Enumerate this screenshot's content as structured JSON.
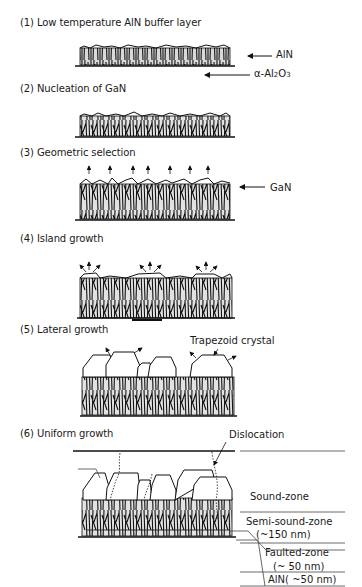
{
  "steps": [
    {
      "number": "(1)",
      "title": "Low temperature AlN buffer layer"
    },
    {
      "number": "(2)",
      "title": "Nucleation of GaN"
    },
    {
      "number": "(3)",
      "title": "Geometric selection"
    },
    {
      "number": "(4)",
      "title": "Island growth"
    },
    {
      "number": "(5)",
      "title": "Lateral growth"
    },
    {
      "number": "(6)",
      "title": "Uniform growth"
    }
  ],
  "labels": {
    "aln": "AlN",
    "sapphire_prefix": "α-Al",
    "sapphire_sub1": "2",
    "sapphire_mid": "O",
    "sapphire_sub2": "3",
    "gan": "GaN",
    "trapezoid": "Trapezoid crystal",
    "dislocation": "Dislocation"
  },
  "zones": [
    {
      "name": "Sound-zone",
      "thickness": ""
    },
    {
      "name": "Semi-sound-zone",
      "thickness": "(~150 nm)"
    },
    {
      "name": "Faulted-zone",
      "thickness": "(~ 50 nm)"
    },
    {
      "name": "AlN( ~50 nm)",
      "thickness": ""
    }
  ]
}
